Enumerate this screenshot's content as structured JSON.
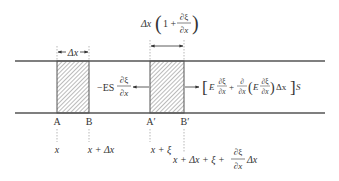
{
  "diagram": {
    "type": "longitudinal-rod-element-displacement",
    "colors": {
      "line": "#555555",
      "text": "#333333",
      "hatch": "#777777",
      "guide": "#888888"
    },
    "rod": {
      "top_rail_y": 61,
      "bottom_rail_y": 113,
      "x_start": 15,
      "x_end": 325
    },
    "elements": [
      {
        "name": "original-element",
        "left_label": "A",
        "right_label": "B",
        "x_left": 57,
        "x_right": 89
      },
      {
        "name": "displaced-element",
        "left_label": "A′",
        "right_label": "B′",
        "x_left": 150,
        "x_right": 184
      }
    ],
    "annotations": {
      "original_width": "Δx",
      "deformed_width_prefix": "Δx",
      "deformed_width_paren_open": "(",
      "deformed_width_one_plus": "1 +",
      "deformed_width_frac_num": "∂ξ",
      "deformed_width_frac_den": "∂x",
      "deformed_width_paren_close": ")",
      "left_force_prefix": "−ES",
      "left_force_frac_num": "∂ξ",
      "left_force_frac_den": "∂x",
      "right_force_bracket_open": "[",
      "right_force_E1": "E",
      "right_force_frac1_num": "∂ξ",
      "right_force_frac1_den": "∂x",
      "right_force_plus": "+",
      "right_force_frac2_num": "∂",
      "right_force_frac2_den": "∂x",
      "right_force_paren_open": "(",
      "right_force_E2": "E",
      "right_force_frac3_num": "∂ξ",
      "right_force_frac3_den": "∂x",
      "right_force_paren_close": ")",
      "right_force_dx": "Δx",
      "right_force_bracket_close": "]",
      "right_force_S": "S"
    },
    "position_labels": {
      "A": "x",
      "B": "x + Δx",
      "A_prime": "x + ξ",
      "B_prime_prefix": "x + Δx + ξ +",
      "B_prime_frac_num": "∂ξ",
      "B_prime_frac_den": "∂x",
      "B_prime_suffix": "Δx"
    }
  }
}
